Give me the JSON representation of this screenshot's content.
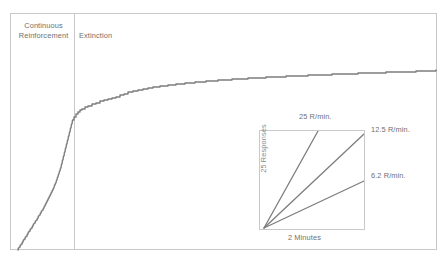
{
  "figure": {
    "type": "cumulative-response-record",
    "frame": {
      "x": 10,
      "y": 13,
      "width": 427,
      "height": 237,
      "border_color": "#c9c9c9"
    },
    "phase_divider": {
      "x": 74,
      "color": "#c9c9c9"
    },
    "phases": [
      {
        "id": "continuous-reinforcement",
        "label": "Continuous\nReinforcement",
        "line1": "Continuous",
        "line2": "Reinforcement"
      },
      {
        "id": "extinction",
        "label": "Extinction"
      }
    ],
    "curve": {
      "color": "#7d7d7d",
      "stroke_width": 1.4,
      "description": "Cumulative responses rising steeply with fine ratchet steps during continuous reinforcement, then decelerating into a negatively accelerated staircase during extinction."
    }
  },
  "inset": {
    "title_hint": "rate calibration",
    "box": {
      "x": 259,
      "y": 130,
      "width": 106,
      "height": 100,
      "border_color": "#c9c9c9"
    },
    "y_axis_label": "25 Responses",
    "x_axis_label": "2 Minutes",
    "lines": [
      {
        "name": "rate-25",
        "label": "25 R/min.",
        "rate": 25,
        "slope_units": "responses per minute"
      },
      {
        "name": "rate-12-5",
        "label": "12.5 R/min.",
        "rate": 12.5,
        "slope_units": "responses per minute"
      },
      {
        "name": "rate-6-2",
        "label": "6.2 R/min.",
        "rate": 6.2,
        "slope_units": "responses per minute"
      }
    ]
  },
  "chart_data": {
    "type": "line",
    "title": "",
    "xlabel": "",
    "ylabel": "",
    "grid": false,
    "legend_position": "inset-bottom-right",
    "series": [
      {
        "name": "cumulative-responses",
        "color": "#7d7d7d",
        "points": [
          [
            18,
            250
          ],
          [
            19,
            248
          ],
          [
            20,
            247
          ],
          [
            21,
            245
          ],
          [
            22,
            244
          ],
          [
            23,
            242
          ],
          [
            24,
            240
          ],
          [
            25,
            239
          ],
          [
            26,
            237
          ],
          [
            27,
            236
          ],
          [
            28,
            234
          ],
          [
            29,
            232
          ],
          [
            30,
            231
          ],
          [
            31,
            229
          ],
          [
            32,
            228
          ],
          [
            33,
            226
          ],
          [
            34,
            224
          ],
          [
            35,
            223
          ],
          [
            36,
            221
          ],
          [
            37,
            220
          ],
          [
            38,
            218
          ],
          [
            39,
            216
          ],
          [
            40,
            215
          ],
          [
            41,
            213
          ],
          [
            42,
            211
          ],
          [
            43,
            210
          ],
          [
            44,
            208
          ],
          [
            45,
            206
          ],
          [
            46,
            204
          ],
          [
            47,
            202
          ],
          [
            48,
            200
          ],
          [
            49,
            198
          ],
          [
            50,
            196
          ],
          [
            51,
            194
          ],
          [
            52,
            192
          ],
          [
            53,
            190
          ],
          [
            54,
            188
          ],
          [
            55,
            185
          ],
          [
            56,
            183
          ],
          [
            57,
            180
          ],
          [
            58,
            177
          ],
          [
            59,
            174
          ],
          [
            60,
            171
          ],
          [
            61,
            168
          ],
          [
            62,
            164
          ],
          [
            63,
            160
          ],
          [
            64,
            156
          ],
          [
            65,
            152
          ],
          [
            66,
            148
          ],
          [
            67,
            144
          ],
          [
            68,
            140
          ],
          [
            69,
            136
          ],
          [
            70,
            132
          ],
          [
            71,
            128
          ],
          [
            72,
            124
          ],
          [
            73,
            120
          ],
          [
            74,
            117
          ],
          [
            76,
            114
          ],
          [
            78,
            112
          ],
          [
            80,
            110
          ],
          [
            82,
            109
          ],
          [
            85,
            107
          ],
          [
            88,
            106
          ],
          [
            92,
            104
          ],
          [
            96,
            103
          ],
          [
            100,
            101
          ],
          [
            104,
            100
          ],
          [
            108,
            99
          ],
          [
            112,
            98
          ],
          [
            116,
            97
          ],
          [
            120,
            95
          ],
          [
            124,
            94
          ],
          [
            128,
            92
          ],
          [
            133,
            91
          ],
          [
            138,
            90
          ],
          [
            143,
            89
          ],
          [
            148,
            88
          ],
          [
            153,
            87
          ],
          [
            160,
            86
          ],
          [
            168,
            85
          ],
          [
            176,
            84
          ],
          [
            185,
            83
          ],
          [
            195,
            82
          ],
          [
            206,
            81
          ],
          [
            218,
            80
          ],
          [
            232,
            79
          ],
          [
            248,
            78
          ],
          [
            266,
            77
          ],
          [
            286,
            76
          ],
          [
            308,
            75
          ],
          [
            332,
            74
          ],
          [
            358,
            73
          ],
          [
            386,
            72
          ],
          [
            416,
            71
          ],
          [
            436,
            70
          ]
        ],
        "note": "x,y in screenshot pixel coordinates; y decreases as cumulative count rises"
      }
    ],
    "annotations": [
      {
        "text": "Continuous Reinforcement",
        "region": "left-of-divider"
      },
      {
        "text": "Extinction",
        "region": "right-of-divider"
      }
    ],
    "inset_calibration": {
      "type": "line",
      "origin": [
        264,
        228
      ],
      "box": [
        259,
        130,
        365,
        230
      ],
      "series": [
        {
          "name": "25 R/min.",
          "end": [
            318,
            131
          ],
          "value": 25
        },
        {
          "name": "12.5 R/min.",
          "end": [
            364,
            134
          ],
          "value": 12.5
        },
        {
          "name": "6.2 R/min.",
          "end": [
            364,
            181
          ],
          "value": 6.2
        }
      ],
      "ylabel": "25 Responses",
      "xlabel": "2 Minutes"
    }
  }
}
